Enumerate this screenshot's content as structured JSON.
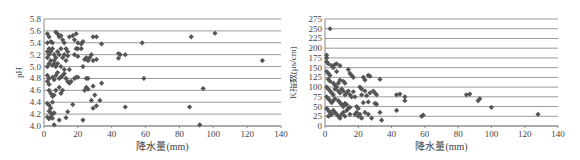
{
  "chart_data": [
    {
      "type": "scatter",
      "title": "",
      "xlabel": "降水量(mm)",
      "ylabel": "pH",
      "xlim": [
        0,
        140
      ],
      "ylim": [
        4.0,
        5.8
      ],
      "x_ticks": [
        "0",
        "20",
        "40",
        "60",
        "80",
        "100",
        "120",
        "140"
      ],
      "y_ticks": [
        "4.0",
        "4.2",
        "4.4",
        "4.6",
        "4.8",
        "5.0",
        "5.2",
        "5.4",
        "5.6",
        "5.8"
      ],
      "grid": true,
      "marker": "diamond",
      "color": "#555555",
      "points": [
        [
          2,
          5.55
        ],
        [
          3,
          5.5
        ],
        [
          4,
          5.42
        ],
        [
          2,
          5.4
        ],
        [
          3,
          5.3
        ],
        [
          2,
          5.25
        ],
        [
          3,
          5.2
        ],
        [
          2,
          5.15
        ],
        [
          4,
          5.1
        ],
        [
          3,
          5.05
        ],
        [
          2,
          5.0
        ],
        [
          5,
          5.02
        ],
        [
          4,
          5.25
        ],
        [
          5,
          5.3
        ],
        [
          6,
          5.2
        ],
        [
          7,
          5.15
        ],
        [
          6,
          5.1
        ],
        [
          5,
          5.4
        ],
        [
          7,
          5.58
        ],
        [
          8,
          5.55
        ],
        [
          9,
          5.5
        ],
        [
          10,
          5.52
        ],
        [
          11,
          5.45
        ],
        [
          12,
          5.4
        ],
        [
          13,
          5.3
        ],
        [
          14,
          5.25
        ],
        [
          15,
          5.5
        ],
        [
          17,
          5.52
        ],
        [
          18,
          5.45
        ],
        [
          19,
          5.55
        ],
        [
          20,
          5.4
        ],
        [
          22,
          5.38
        ],
        [
          23,
          5.42
        ],
        [
          19,
          5.3
        ],
        [
          20,
          5.3
        ],
        [
          22,
          5.3
        ],
        [
          18,
          5.2
        ],
        [
          20,
          5.17
        ],
        [
          8,
          5.25
        ],
        [
          9,
          5.2
        ],
        [
          10,
          5.3
        ],
        [
          11,
          5.15
        ],
        [
          12,
          5.2
        ],
        [
          13,
          5.1
        ],
        [
          14,
          5.18
        ],
        [
          6,
          5.05
        ],
        [
          7,
          5.0
        ],
        [
          8,
          5.05
        ],
        [
          10,
          5.0
        ],
        [
          12,
          4.95
        ],
        [
          15,
          4.95
        ],
        [
          26,
          5.1
        ],
        [
          27,
          5.15
        ],
        [
          28,
          5.2
        ],
        [
          29,
          5.1
        ],
        [
          24,
          5.12
        ],
        [
          25,
          5.15
        ],
        [
          31,
          5.12
        ],
        [
          29,
          5.5
        ],
        [
          31,
          5.5
        ],
        [
          34,
          5.38
        ],
        [
          44,
          5.22
        ],
        [
          45,
          5.2
        ],
        [
          48,
          5.2
        ],
        [
          44,
          5.14
        ],
        [
          58,
          5.4
        ],
        [
          87,
          5.5
        ],
        [
          101,
          5.56
        ],
        [
          129,
          5.1
        ],
        [
          2,
          4.85
        ],
        [
          3,
          4.8
        ],
        [
          2,
          4.75
        ],
        [
          3,
          4.7
        ],
        [
          5,
          4.82
        ],
        [
          6,
          4.78
        ],
        [
          7,
          4.85
        ],
        [
          8,
          4.9
        ],
        [
          9,
          4.8
        ],
        [
          10,
          4.82
        ],
        [
          11,
          4.85
        ],
        [
          12,
          4.88
        ],
        [
          13,
          4.8
        ],
        [
          14,
          4.75
        ],
        [
          15,
          4.72
        ],
        [
          16,
          4.75
        ],
        [
          18,
          4.8
        ],
        [
          19,
          4.82
        ],
        [
          20,
          4.82
        ],
        [
          23,
          5.0
        ],
        [
          25,
          4.8
        ],
        [
          26,
          4.8
        ],
        [
          59,
          4.8
        ],
        [
          3,
          4.6
        ],
        [
          4,
          4.55
        ],
        [
          5,
          4.5
        ],
        [
          6,
          4.52
        ],
        [
          7,
          4.6
        ],
        [
          9,
          4.65
        ],
        [
          10,
          4.55
        ],
        [
          11,
          4.6
        ],
        [
          24,
          4.6
        ],
        [
          25,
          4.65
        ],
        [
          26,
          4.62
        ],
        [
          29,
          4.67
        ],
        [
          34,
          4.72
        ],
        [
          94,
          4.63
        ],
        [
          2,
          4.38
        ],
        [
          3,
          4.35
        ],
        [
          4,
          4.3
        ],
        [
          5,
          4.4
        ],
        [
          3,
          4.25
        ],
        [
          4,
          4.22
        ],
        [
          5,
          4.2
        ],
        [
          6,
          4.22
        ],
        [
          2,
          4.15
        ],
        [
          3,
          4.12
        ],
        [
          4,
          4.15
        ],
        [
          5,
          4.13
        ],
        [
          14,
          4.24
        ],
        [
          17,
          4.36
        ],
        [
          13,
          4.14
        ],
        [
          9,
          4.1
        ],
        [
          23,
          4.1
        ],
        [
          28,
          4.43
        ],
        [
          30,
          4.52
        ],
        [
          29,
          4.3
        ],
        [
          31,
          4.34
        ],
        [
          33,
          4.43
        ],
        [
          48,
          4.32
        ],
        [
          86,
          4.32
        ],
        [
          6,
          4.02
        ],
        [
          92,
          4.02
        ]
      ]
    },
    {
      "type": "scatter",
      "title": "",
      "xlabel": "降水量(mm)",
      "ylabel": "K指数(μs/cm)",
      "xlim": [
        0,
        140
      ],
      "ylim": [
        0,
        275
      ],
      "x_ticks": [
        "0",
        "20",
        "40",
        "60",
        "80",
        "100",
        "120",
        "140"
      ],
      "y_ticks": [
        "0",
        "25",
        "50",
        "75",
        "100",
        "125",
        "150",
        "175",
        "200",
        "225",
        "250",
        "275"
      ],
      "grid": true,
      "marker": "diamond",
      "color": "#555555",
      "points": [
        [
          3,
          250
        ],
        [
          1,
          182
        ],
        [
          1,
          175
        ],
        [
          1,
          165
        ],
        [
          2,
          160
        ],
        [
          4,
          155
        ],
        [
          5,
          150
        ],
        [
          6,
          158
        ],
        [
          7,
          160
        ],
        [
          9,
          155
        ],
        [
          1,
          140
        ],
        [
          2,
          135
        ],
        [
          3,
          130
        ],
        [
          7,
          140
        ],
        [
          2,
          120
        ],
        [
          3,
          115
        ],
        [
          5,
          110
        ],
        [
          6,
          105
        ],
        [
          8,
          110
        ],
        [
          9,
          118
        ],
        [
          11,
          115
        ],
        [
          12,
          110
        ],
        [
          14,
          145
        ],
        [
          15,
          135
        ],
        [
          16,
          130
        ],
        [
          17,
          125
        ],
        [
          23,
          125
        ],
        [
          26,
          130
        ],
        [
          27,
          128
        ],
        [
          33,
          120
        ],
        [
          24,
          118
        ],
        [
          1,
          100
        ],
        [
          2,
          95
        ],
        [
          3,
          90
        ],
        [
          4,
          85
        ],
        [
          5,
          80
        ],
        [
          6,
          95
        ],
        [
          7,
          100
        ],
        [
          8,
          90
        ],
        [
          9,
          85
        ],
        [
          10,
          95
        ],
        [
          11,
          90
        ],
        [
          12,
          80
        ],
        [
          13,
          85
        ],
        [
          14,
          90
        ],
        [
          15,
          80
        ],
        [
          16,
          75
        ],
        [
          17,
          88
        ],
        [
          18,
          75
        ],
        [
          21,
          100
        ],
        [
          22,
          95
        ],
        [
          24,
          90
        ],
        [
          27,
          85
        ],
        [
          29,
          90
        ],
        [
          30,
          85
        ],
        [
          31,
          80
        ],
        [
          22,
          80
        ],
        [
          25,
          78
        ],
        [
          1,
          75
        ],
        [
          2,
          70
        ],
        [
          3,
          65
        ],
        [
          4,
          60
        ],
        [
          5,
          65
        ],
        [
          6,
          70
        ],
        [
          8,
          65
        ],
        [
          9,
          60
        ],
        [
          10,
          55
        ],
        [
          11,
          50
        ],
        [
          12,
          58
        ],
        [
          13,
          55
        ],
        [
          15,
          48
        ],
        [
          19,
          50
        ],
        [
          20,
          45
        ],
        [
          23,
          60
        ],
        [
          26,
          62
        ],
        [
          30,
          58
        ],
        [
          31,
          56
        ],
        [
          43,
          80
        ],
        [
          45,
          82
        ],
        [
          48,
          75
        ],
        [
          48,
          65
        ],
        [
          85,
          80
        ],
        [
          87,
          82
        ],
        [
          92,
          65
        ],
        [
          93,
          70
        ],
        [
          100,
          48
        ],
        [
          128,
          30
        ],
        [
          1,
          45
        ],
        [
          2,
          40
        ],
        [
          3,
          35
        ],
        [
          4,
          30
        ],
        [
          5,
          40
        ],
        [
          6,
          35
        ],
        [
          7,
          30
        ],
        [
          8,
          25
        ],
        [
          9,
          20
        ],
        [
          10,
          30
        ],
        [
          11,
          35
        ],
        [
          12,
          25
        ],
        [
          13,
          40
        ],
        [
          14,
          45
        ],
        [
          15,
          30
        ],
        [
          18,
          30
        ],
        [
          19,
          35
        ],
        [
          20,
          25
        ],
        [
          21,
          30
        ],
        [
          22,
          20
        ],
        [
          24,
          35
        ],
        [
          26,
          30
        ],
        [
          28,
          20
        ],
        [
          33,
          35
        ],
        [
          34,
          15
        ],
        [
          43,
          40
        ],
        [
          58,
          25
        ],
        [
          59,
          28
        ],
        [
          2,
          25
        ],
        [
          3,
          28
        ]
      ]
    }
  ]
}
